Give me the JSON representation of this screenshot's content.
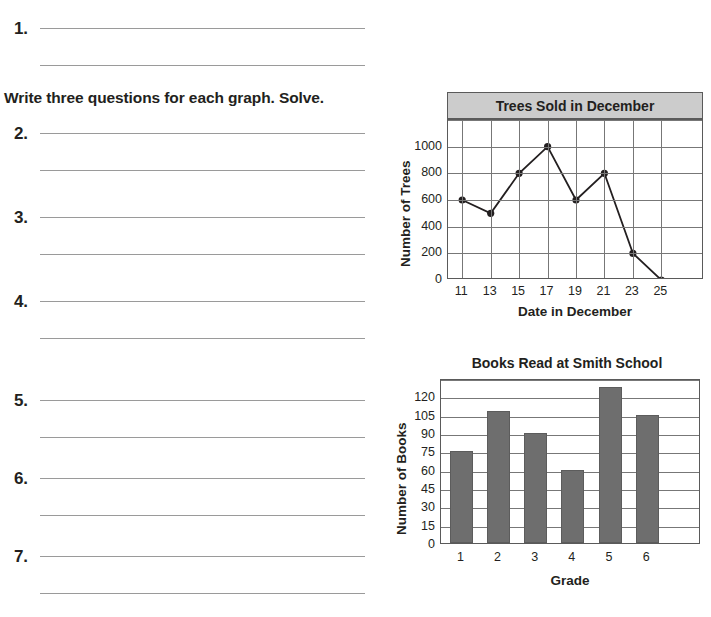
{
  "worksheet": {
    "instruction": "Write three questions for each graph. Solve.",
    "items": [
      {
        "number": "1."
      },
      {
        "number": "2."
      },
      {
        "number": "3."
      },
      {
        "number": "4."
      },
      {
        "number": "5."
      },
      {
        "number": "6."
      },
      {
        "number": "7."
      }
    ]
  },
  "chart_data": [
    {
      "type": "line",
      "title": "Trees Sold in December",
      "xlabel": "Date in December",
      "ylabel": "Number of Trees",
      "categories": [
        "11",
        "13",
        "15",
        "17",
        "19",
        "21",
        "23",
        "25"
      ],
      "x": [
        11,
        13,
        15,
        17,
        19,
        21,
        23,
        25
      ],
      "values": [
        600,
        500,
        800,
        1000,
        600,
        800,
        200,
        0
      ],
      "yticks": [
        "0",
        "200",
        "400",
        "600",
        "800",
        "1000"
      ],
      "ytick_values": [
        0,
        200,
        400,
        600,
        800,
        1000
      ],
      "ylim": [
        0,
        1200
      ],
      "grid": true,
      "legend": "none",
      "marker": "filled-circle",
      "line_color": "#231f20",
      "title_background": "#cccccc"
    },
    {
      "type": "bar",
      "title": "Books Read at Smith School",
      "xlabel": "Grade",
      "ylabel": "Number of Books",
      "categories": [
        "1",
        "2",
        "3",
        "4",
        "5",
        "6"
      ],
      "values": [
        75,
        108,
        90,
        60,
        128,
        105
      ],
      "yticks": [
        "0",
        "15",
        "30",
        "45",
        "60",
        "75",
        "90",
        "105",
        "120"
      ],
      "ytick_values": [
        0,
        15,
        30,
        45,
        60,
        75,
        90,
        105,
        120
      ],
      "ylim": [
        0,
        135
      ],
      "grid": true,
      "legend": "none",
      "bar_color": "#6e6e6e"
    }
  ]
}
